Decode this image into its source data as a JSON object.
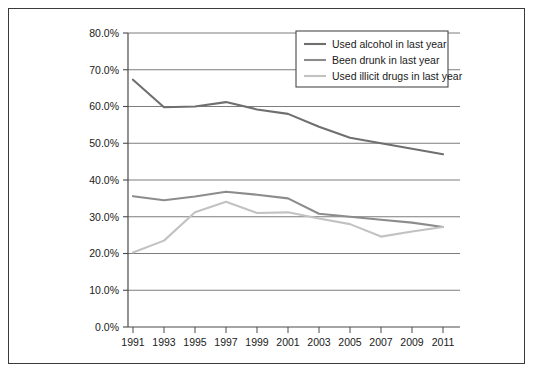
{
  "chart_data": {
    "type": "line",
    "title": "",
    "subtitle": "",
    "xlabel": "",
    "ylabel": "",
    "x": [
      1991,
      1993,
      1995,
      1997,
      1999,
      2001,
      2003,
      2005,
      2007,
      2009,
      2011
    ],
    "xtick_labels": [
      "1991",
      "1993",
      "1995",
      "1997",
      "1999",
      "2001",
      "2003",
      "2005",
      "2007",
      "2009",
      "2011"
    ],
    "ytick_labels": [
      "0.0%",
      "10.0%",
      "20.0%",
      "30.0%",
      "40.0%",
      "50.0%",
      "60.0%",
      "70.0%",
      "80.0%"
    ],
    "ytick_values": [
      0,
      10,
      20,
      30,
      40,
      50,
      60,
      70,
      80
    ],
    "ylim": [
      0,
      80
    ],
    "xlim": [
      1991,
      2011
    ],
    "grid": true,
    "grid_axis": "y",
    "legend_position": "top-right-inside",
    "series": [
      {
        "name": "Used alcohol in last year",
        "color": "#6f6f6f",
        "values": [
          67.3,
          59.8,
          60.0,
          61.2,
          59.2,
          58.0,
          54.5,
          51.5,
          50.0,
          48.5,
          47.0
        ]
      },
      {
        "name": "Been drunk in last year",
        "color": "#8c8c8c",
        "values": [
          35.6,
          34.5,
          35.5,
          36.8,
          36.0,
          35.0,
          30.8,
          30.0,
          29.2,
          28.4,
          27.2
        ]
      },
      {
        "name": "Used illicit drugs in last year",
        "color": "#c2c2c2",
        "values": [
          20.3,
          23.5,
          31.2,
          34.1,
          31.0,
          31.2,
          29.5,
          28.0,
          24.6,
          26.0,
          27.2
        ]
      }
    ]
  },
  "legend": {
    "items": [
      {
        "label": "Used alcohol in last year",
        "color": "#6f6f6f"
      },
      {
        "label": "Been drunk in last year",
        "color": "#8c8c8c"
      },
      {
        "label": "Used illicit drugs in last year",
        "color": "#c2c2c2"
      }
    ]
  },
  "colors": {
    "frame_border": "#3a3a3a",
    "axis": "#4a4a4a",
    "gridline": "#7d7d7d",
    "background": "#ffffff",
    "text": "#1a1a1a"
  }
}
